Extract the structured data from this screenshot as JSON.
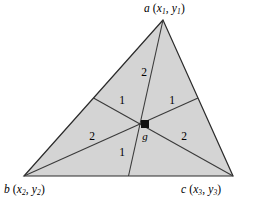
{
  "figure": {
    "type": "geometry-diagram",
    "background_color": "#ffffff",
    "fill_color": "#d4d4d4",
    "stroke_color": "#3a3a3a",
    "outline_color": "#2b2b2b",
    "vertices": [
      {
        "id": "a",
        "name": "a",
        "x_sub": "1",
        "y_sub": "1",
        "px": 163,
        "py": 20,
        "label_prefix": "a",
        "label_full": "a (x1, y1)"
      },
      {
        "id": "b",
        "name": "b",
        "x_sub": "2",
        "y_sub": "2",
        "px": 24,
        "py": 176,
        "label_prefix": "b",
        "label_full": "b (x2, y2)"
      },
      {
        "id": "c",
        "name": "c",
        "x_sub": "3",
        "y_sub": "3",
        "px": 233,
        "py": 176,
        "label_prefix": "c",
        "label_full": "c (x3, y3)"
      }
    ],
    "midpoints": [
      {
        "id": "mid-ab",
        "px": 93.5,
        "py": 98
      },
      {
        "id": "mid-ac",
        "px": 198,
        "py": 98
      },
      {
        "id": "mid-bc",
        "px": 128.5,
        "py": 176
      }
    ],
    "centroid": {
      "id": "g",
      "label": "g",
      "px": 145,
      "py": 124,
      "marker": "square"
    },
    "region_labels": [
      {
        "id": "top",
        "value": "2",
        "px": 144,
        "py": 72
      },
      {
        "id": "upper-left",
        "value": "1",
        "px": 122,
        "py": 100
      },
      {
        "id": "upper-right",
        "value": "1",
        "px": 172,
        "py": 100
      },
      {
        "id": "left",
        "value": "2",
        "px": 92,
        "py": 136
      },
      {
        "id": "right",
        "value": "2",
        "px": 184,
        "py": 136
      },
      {
        "id": "bottom",
        "value": "1",
        "px": 122,
        "py": 152
      }
    ]
  }
}
